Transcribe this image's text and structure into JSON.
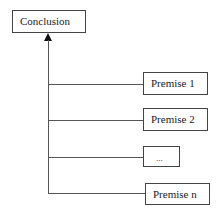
{
  "diagram": {
    "conclusion": {
      "label": "Conclusion"
    },
    "premises": [
      {
        "label": "Premise 1"
      },
      {
        "label": "Premise 2"
      },
      {
        "label": "..."
      },
      {
        "label": "Premise n"
      }
    ]
  }
}
